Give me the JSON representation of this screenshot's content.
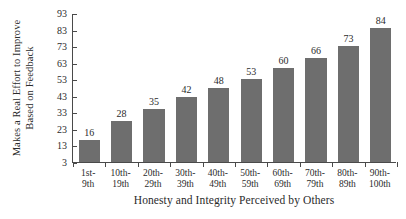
{
  "chart_data": {
    "type": "bar",
    "title": "",
    "xlabel": "Honesty and Integrity Perceived by Others",
    "ylabel": "Makes a Real Effort to Improve Based on Feedback",
    "ylabel_lines": [
      "Makes a Real Effort to Improve",
      "Based on Feedback"
    ],
    "categories": [
      "1st-9th",
      "10th-19th",
      "20th-29th",
      "30th-39th",
      "40th-49th",
      "50th-59th",
      "60th-69th",
      "70th-79th",
      "80th-89th",
      "90th-100th"
    ],
    "category_lines": [
      [
        "1st-",
        "9th"
      ],
      [
        "10th-",
        "19th"
      ],
      [
        "20th-",
        "29th"
      ],
      [
        "30th-",
        "39th"
      ],
      [
        "40th-",
        "49th"
      ],
      [
        "50th-",
        "59th"
      ],
      [
        "60th-",
        "69th"
      ],
      [
        "70th-",
        "79th"
      ],
      [
        "80th-",
        "89th"
      ],
      [
        "90th-",
        "100th"
      ]
    ],
    "values": [
      16,
      28,
      35,
      42,
      48,
      53,
      60,
      66,
      73,
      84
    ],
    "ylim": [
      3,
      93
    ],
    "yticks": [
      3,
      13,
      23,
      33,
      43,
      53,
      63,
      73,
      83,
      93
    ],
    "grid": false,
    "legend": null,
    "bar_color": "#6e6e6e",
    "axis_color": "#4a4a4a",
    "background_color": "#ffffff"
  }
}
